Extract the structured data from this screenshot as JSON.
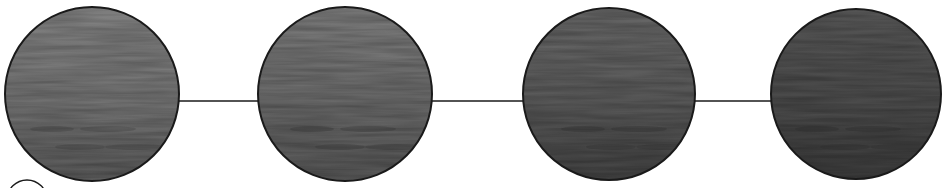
{
  "diagram": {
    "type": "sequence-of-circles",
    "background": "#ffffff",
    "stroke_color": "#1a1a1a",
    "connector_y": 101,
    "nodes": [
      {
        "id": "node-1",
        "cx": 92,
        "cy": 94,
        "r": 87,
        "shade_top": "#8c8c8c",
        "shade_mid": "#7a7a7a",
        "shade_bottom": "#5e5e5e",
        "tone": "light water"
      },
      {
        "id": "node-2",
        "cx": 345,
        "cy": 94,
        "r": 87,
        "shade_top": "#858585",
        "shade_mid": "#707070",
        "shade_bottom": "#5a5a5a",
        "tone": "medium-light water"
      },
      {
        "id": "node-3",
        "cx": 609,
        "cy": 94,
        "r": 86,
        "shade_top": "#6e6e6e",
        "shade_mid": "#5f5f5f",
        "shade_bottom": "#454545",
        "tone": "medium-dark water"
      },
      {
        "id": "node-4",
        "cx": 856,
        "cy": 94,
        "r": 85,
        "shade_top": "#5c5c5c",
        "shade_mid": "#505050",
        "shade_bottom": "#3e3e3e",
        "tone": "dark water"
      }
    ],
    "connectors": [
      {
        "from": "node-1",
        "to": "node-2",
        "x1": 179,
        "x2": 258
      },
      {
        "from": "node-2",
        "to": "node-3",
        "x1": 432,
        "x2": 523
      },
      {
        "from": "node-3",
        "to": "node-4",
        "x1": 695,
        "x2": 771
      }
    ],
    "partial_outline": {
      "cx": 27,
      "cy": 200,
      "r": 20
    }
  }
}
